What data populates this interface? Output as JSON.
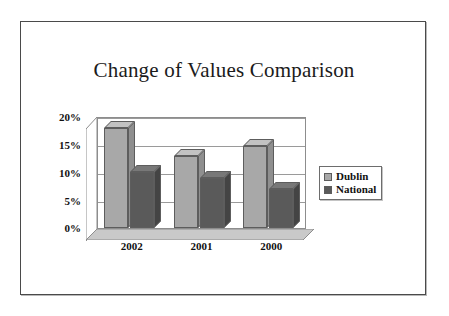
{
  "chart_data": {
    "type": "bar",
    "title": "Change of Values Comparison",
    "xlabel": "",
    "ylabel": "",
    "categories": [
      "2002",
      "2001",
      "2000"
    ],
    "series": [
      {
        "name": "Dublin",
        "color": "#a8a8a8",
        "values": [
          17.8,
          12.8,
          14.7
        ]
      },
      {
        "name": "National",
        "color": "#5a5a5a",
        "values": [
          10.0,
          9.0,
          7.0
        ]
      }
    ],
    "ylim": [
      0,
      20
    ],
    "yticks": [
      20,
      15,
      10,
      5,
      0
    ],
    "ytick_labels": [
      "20%",
      "15%",
      "10%",
      "5%",
      "0%"
    ],
    "grid": true,
    "legend_position": "right",
    "style": "3d-column",
    "plot_background": "#ffffff"
  },
  "legend": {
    "items": [
      {
        "label": "Dublin",
        "color": "#a8a8a8"
      },
      {
        "label": "National",
        "color": "#5a5a5a"
      }
    ]
  },
  "colors": {
    "dublin": "#a8a8a8",
    "national": "#5a5a5a",
    "frame": "#4a4a4a",
    "gridline": "#9a9a9a",
    "text": "#111111"
  }
}
